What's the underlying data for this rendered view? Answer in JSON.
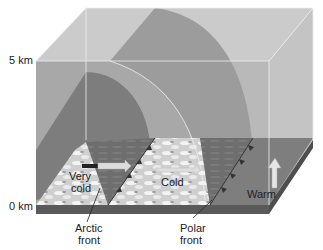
{
  "axis": {
    "top_label": "5 km",
    "bottom_label": "0 km"
  },
  "air_masses": {
    "very_cold_line1": "Very",
    "very_cold_line2": "cold",
    "cold": "Cold",
    "warm": "Warm"
  },
  "fronts": {
    "arctic_line1": "Arctic",
    "arctic_line2": "front",
    "polar_line1": "Polar",
    "polar_line2": "front"
  },
  "colors": {
    "box_light": "#c8c8c8",
    "box_mid": "#a9a9a9",
    "dome_dark": "#7a7a7a",
    "ground_dark": "#6b6b6b",
    "ground_slab": "#555555",
    "edge_line": "#eeeeee"
  }
}
